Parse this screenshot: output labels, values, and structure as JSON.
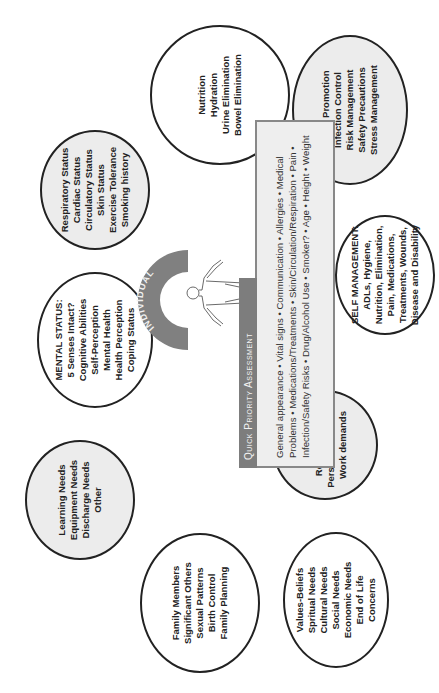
{
  "diagram": {
    "center": {
      "label": "INDIVIDUAL"
    },
    "quick_priority": {
      "title": "Quick Priority Assessment",
      "lines": [
        "General appearance • Vital signs • Communication • Allergies • Medical",
        "Problems • Medications/Treatments • Skin/Circulation/Respiration • Pain •",
        "Infection/Safety Risks • Drug/Alcohol Use • Smoker? • Age • Height • Weight"
      ]
    },
    "ellipses": [
      {
        "id": "nutrition",
        "fill": "white",
        "lines": [
          "Nutrition",
          "Hydration",
          "Urine Elimination",
          "Bowel Elimination"
        ]
      },
      {
        "id": "respiratory",
        "fill": "gray",
        "lines": [
          "Respiratory Status",
          "Cardiac Status",
          "Circulatory Status",
          "Skin Status",
          "Exercise Tolerance",
          "Smoking history"
        ]
      },
      {
        "id": "health-promotion",
        "fill": "gray",
        "lines": [
          "Health Promotion",
          "Infection Control",
          "Risk Management",
          "Safety Precautions",
          "Stress Management"
        ]
      },
      {
        "id": "mental-status",
        "fill": "white",
        "lines": [
          "MENTAL STATUS:",
          "5 Senses Intact?",
          "Cognitive Abilities",
          "Self-Perception",
          "Mental Health",
          "Health Perception",
          "Coping Status"
        ]
      },
      {
        "id": "self-management",
        "fill": "white",
        "lines": [
          "SELF MANAGEMENT:",
          "ADLs, Hygiene,",
          "Nutrition, Elimination,",
          "Pain, Medications,",
          "Treatments, Wounds,",
          "Disease and Disability"
        ]
      },
      {
        "id": "learning-needs",
        "fill": "gray",
        "lines": [
          "Learning Needs",
          "Equipment Needs",
          "Discharge Needs",
          "Other"
        ]
      },
      {
        "id": "roles",
        "fill": "gray",
        "lines": [
          "Roles",
          "Relationships",
          "Personal Demands",
          "Work demands"
        ]
      },
      {
        "id": "family",
        "fill": "white",
        "lines": [
          "Family Members",
          "Significant Others",
          "Sexual Patterns",
          "Birth Control",
          "Family Planning"
        ]
      },
      {
        "id": "values",
        "fill": "white",
        "lines": [
          "Values-Beliefs",
          "Spritual Needs",
          "Cultural Needs",
          "Social Needs",
          "Economic Needs",
          "End of Life",
          "Concerns"
        ]
      }
    ],
    "colors": {
      "outline": "#222222",
      "gray_fill": "#ececec",
      "header_fill": "#7d7d7d",
      "box_fill": "#eeeeee",
      "arc_fill": "#808080"
    }
  }
}
